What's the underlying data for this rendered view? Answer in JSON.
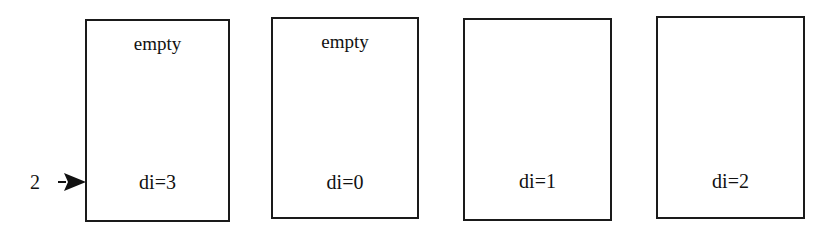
{
  "diagram": {
    "pointer": {
      "label": "2",
      "target_box": 0
    },
    "boxes": [
      {
        "top": "empty",
        "bottom": "di=3"
      },
      {
        "top": "empty",
        "bottom": "di=0"
      },
      {
        "top": "",
        "bottom": "di=1"
      },
      {
        "top": "",
        "bottom": "di=2"
      }
    ]
  }
}
